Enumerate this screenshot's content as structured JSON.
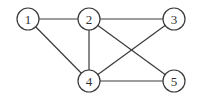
{
  "graph": {
    "node_radius": 11,
    "colors": {
      "stroke": "#3a3a3a",
      "fill": "#ffffff",
      "label": "#333333",
      "background": "#ffffff"
    },
    "nodes": [
      {
        "id": "1",
        "label": "1",
        "x": 28,
        "y": 19
      },
      {
        "id": "2",
        "label": "2",
        "x": 89,
        "y": 19
      },
      {
        "id": "3",
        "label": "3",
        "x": 174,
        "y": 19
      },
      {
        "id": "4",
        "label": "4",
        "x": 89,
        "y": 81
      },
      {
        "id": "5",
        "label": "5",
        "x": 174,
        "y": 81
      }
    ],
    "edges": [
      {
        "from": "1",
        "to": "2"
      },
      {
        "from": "1",
        "to": "4"
      },
      {
        "from": "2",
        "to": "3"
      },
      {
        "from": "2",
        "to": "4"
      },
      {
        "from": "2",
        "to": "5"
      },
      {
        "from": "3",
        "to": "4"
      },
      {
        "from": "4",
        "to": "5"
      }
    ]
  }
}
